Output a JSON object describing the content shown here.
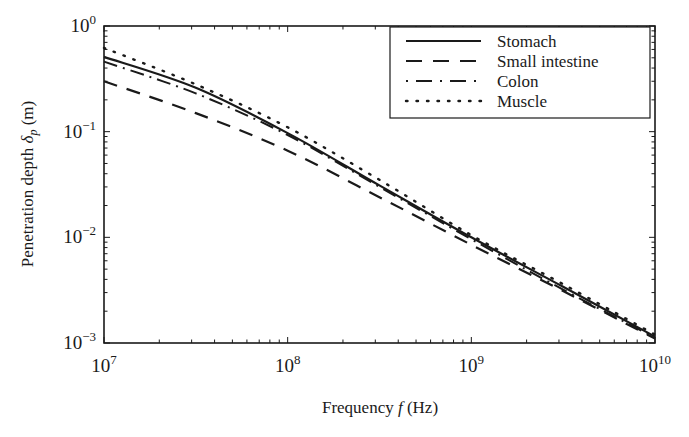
{
  "chart_data": {
    "type": "line",
    "title": "",
    "xlabel": "Frequency f (Hz)",
    "xlabel_parts": {
      "pre": "Frequency ",
      "var": "f",
      "post": " (Hz)"
    },
    "ylabel": "Penetration depth δp (m)",
    "ylabel_parts": {
      "pre": "Penetration depth ",
      "var": "δ",
      "sub": "p",
      "post": " (m)"
    },
    "xscale": "log",
    "yscale": "log",
    "xlim": [
      10000000,
      10000000000
    ],
    "ylim": [
      0.001,
      1
    ],
    "grid": false,
    "legend_position": "upper right",
    "x_ticks": [
      {
        "base": "10",
        "exp": "7",
        "value": 10000000
      },
      {
        "base": "10",
        "exp": "8",
        "value": 100000000
      },
      {
        "base": "10",
        "exp": "9",
        "value": 1000000000
      },
      {
        "base": "10",
        "exp": "10",
        "value": 10000000000
      }
    ],
    "y_ticks": [
      {
        "base": "10",
        "exp": "0",
        "value": 1
      },
      {
        "base": "10",
        "exp": "−1",
        "value": 0.1
      },
      {
        "base": "10",
        "exp": "−2",
        "value": 0.01
      },
      {
        "base": "10",
        "exp": "−3",
        "value": 0.001
      }
    ],
    "x": [
      10000000,
      31600000,
      100000000,
      316000000,
      1000000000,
      3160000000,
      10000000000
    ],
    "series": [
      {
        "name": "Stomach",
        "style": "solid",
        "values": [
          0.51,
          0.26,
          0.097,
          0.031,
          0.01,
          0.0034,
          0.00115
        ]
      },
      {
        "name": "Small intestine",
        "style": "dashed",
        "values": [
          0.3,
          0.15,
          0.066,
          0.024,
          0.0085,
          0.0031,
          0.0011
        ]
      },
      {
        "name": "Colon",
        "style": "dashdot",
        "values": [
          0.46,
          0.23,
          0.093,
          0.03,
          0.0096,
          0.0032,
          0.00112
        ]
      },
      {
        "name": "Muscle",
        "style": "dotted",
        "values": [
          0.62,
          0.28,
          0.11,
          0.035,
          0.0105,
          0.0036,
          0.0012
        ]
      }
    ]
  },
  "colors": {
    "line": "#1a1a1a",
    "background": "#ffffff",
    "axis": "#1a1a1a"
  }
}
